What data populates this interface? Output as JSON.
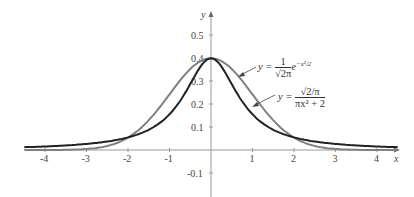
{
  "chart_data": {
    "type": "line",
    "title": "",
    "xlabel": "x",
    "ylabel": "y",
    "xlim": [
      -4.5,
      4.5
    ],
    "ylim": [
      -0.15,
      0.6
    ],
    "grid": false,
    "x_ticks": [
      "-4",
      "-3",
      "-2",
      "-1",
      "1",
      "2",
      "3",
      "4"
    ],
    "y_ticks": [
      "0.5",
      "0.4",
      "0.3",
      "0.2",
      "0.1",
      "-0.1"
    ],
    "series": [
      {
        "name": "y = (1/√(2π)) e^(−x²/2)",
        "color": "#808080",
        "x": [
          -4.5,
          -4,
          -3,
          -2,
          -1,
          -0.5,
          0,
          0.5,
          1,
          2,
          3,
          4,
          4.5
        ],
        "values": [
          0.0,
          0.0001,
          0.0044,
          0.054,
          0.242,
          0.3521,
          0.3989,
          0.3521,
          0.242,
          0.054,
          0.0044,
          0.0001,
          0.0
        ]
      },
      {
        "name": "y = √(2/π) / (πx² + 2)",
        "color": "#222222",
        "x": [
          -4.5,
          -4,
          -3,
          -2,
          -1,
          -0.5,
          0,
          0.5,
          1,
          2,
          3,
          4,
          4.5
        ],
        "values": [
          0.0122,
          0.0154,
          0.0269,
          0.0553,
          0.1552,
          0.2816,
          0.3989,
          0.2816,
          0.1552,
          0.0553,
          0.0269,
          0.0154,
          0.0122
        ]
      }
    ],
    "annotations": [
      {
        "text": "y = (1/√(2π)) e^(−x²/2)",
        "points_to": "gray curve"
      },
      {
        "text": "y = √(2/π) / (πx² + 2)",
        "points_to": "dark curve"
      }
    ]
  },
  "labels": {
    "x_axis": "x",
    "y_axis": "y",
    "ann1": {
      "lhs": "y =",
      "num": "1",
      "den": "√2π",
      "exp_base": "e",
      "exp": "−x²/2"
    },
    "ann2": {
      "lhs": "y =",
      "num": "√2/π",
      "den": "πx² + 2"
    }
  }
}
